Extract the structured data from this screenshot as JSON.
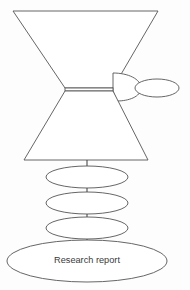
{
  "canvas": {
    "width": 190,
    "height": 290,
    "background": "#fdfdfd",
    "stroke_color": "#555555",
    "fill_color": "#ffffff",
    "text_color": "#3a3a3a"
  },
  "diagram": {
    "type": "flow-funnel-diagram",
    "title": "",
    "nodes": [
      {
        "id": "upper-funnel",
        "shape": "inverted-trapezoid",
        "label": "",
        "geometry": {
          "top_left_x": 13,
          "top_right_x": 158,
          "top_y": 11,
          "bottom_left_x": 65,
          "bottom_right_x": 113,
          "bottom_y": 88
        }
      },
      {
        "id": "waist-band",
        "shape": "narrow-horizontal-band",
        "label": "",
        "geometry": {
          "x": 65,
          "y": 88,
          "width": 48,
          "height": 3
        }
      },
      {
        "id": "side-pouch",
        "shape": "curved-pouch",
        "label": "",
        "geometry": {
          "attach_top_x": 113,
          "attach_top_y": 73,
          "bulge_x": 141,
          "attach_bottom_x": 117,
          "attach_bottom_y": 101
        }
      },
      {
        "id": "side-ellipse",
        "shape": "ellipse",
        "label": "",
        "geometry": {
          "cx": 157,
          "cy": 88,
          "rx": 22,
          "ry": 9
        }
      },
      {
        "id": "lower-funnel",
        "shape": "trapezoid",
        "label": "",
        "geometry": {
          "top_left_x": 65,
          "top_right_x": 113,
          "top_y": 91,
          "bottom_left_x": 24,
          "bottom_right_x": 148,
          "bottom_y": 160
        }
      },
      {
        "id": "stage-ellipse-1",
        "shape": "ellipse",
        "label": "",
        "geometry": {
          "cx": 87,
          "cy": 177,
          "rx": 41,
          "ry": 11
        }
      },
      {
        "id": "stage-ellipse-2",
        "shape": "ellipse",
        "label": "",
        "geometry": {
          "cx": 87,
          "cy": 203,
          "rx": 41,
          "ry": 11
        }
      },
      {
        "id": "stage-ellipse-3",
        "shape": "ellipse",
        "label": "",
        "geometry": {
          "cx": 87,
          "cy": 228,
          "rx": 41,
          "ry": 11
        }
      },
      {
        "id": "research-report",
        "shape": "ellipse",
        "label": "Research report",
        "geometry": {
          "cx": 87,
          "cy": 261,
          "rx": 80,
          "ry": 21
        }
      }
    ],
    "connectors": [
      {
        "id": "connector-funnel-to-e1",
        "x": 87,
        "y1": 160,
        "y2": 166
      },
      {
        "id": "connector-e1-to-e2",
        "x": 87,
        "y1": 188,
        "y2": 192
      },
      {
        "id": "connector-e2-to-e3",
        "x": 87,
        "y1": 214,
        "y2": 217
      },
      {
        "id": "connector-e3-to-report",
        "x": 87,
        "y1": 239,
        "y2": 243
      }
    ],
    "labels": {
      "research_report": "Research report"
    }
  }
}
